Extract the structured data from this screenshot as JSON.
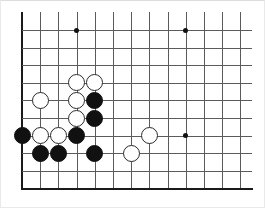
{
  "figure": {
    "board_size": 19,
    "view": "lower-left corner crop",
    "visible_columns": 13,
    "visible_rows": 10
  },
  "board": {
    "origin_x": 22,
    "origin_y": 30,
    "spacing_x": 18.2,
    "spacing_y": 17.6,
    "columns": 13,
    "rows": 10,
    "grid_color": "#5b5b5b",
    "edge_color": "#1a1a1a",
    "background_color": "#ffffff",
    "left_edge_is_board_border": true,
    "bottom_edge_is_board_border": true,
    "grid_bleeds_top": true,
    "grid_bleeds_right": true,
    "grid_top_overhang": 18,
    "grid_right_overhang": 12
  },
  "star_points": [
    {
      "name": "star-point-c4-top-left",
      "col": 4,
      "row": 1
    },
    {
      "name": "star-point-c10-top",
      "col": 10,
      "row": 1
    },
    {
      "name": "star-point-c10-r7",
      "col": 10,
      "row": 7
    }
  ],
  "stones": [
    {
      "name": "white-stone-c4-r4",
      "color": "white",
      "col": 4,
      "row": 4
    },
    {
      "name": "white-stone-c5-r4",
      "color": "white",
      "col": 5,
      "row": 4
    },
    {
      "name": "white-stone-c2-r5",
      "color": "white",
      "col": 2,
      "row": 5
    },
    {
      "name": "white-stone-c4-r5",
      "color": "white",
      "col": 4,
      "row": 5
    },
    {
      "name": "black-stone-c5-r5",
      "color": "black",
      "col": 5,
      "row": 5
    },
    {
      "name": "white-stone-c4-r6",
      "color": "white",
      "col": 4,
      "row": 6
    },
    {
      "name": "black-stone-c5-r6",
      "color": "black",
      "col": 5,
      "row": 6
    },
    {
      "name": "black-stone-c1-r7",
      "color": "black",
      "col": 1,
      "row": 7
    },
    {
      "name": "white-stone-c2-r7",
      "color": "white",
      "col": 2,
      "row": 7
    },
    {
      "name": "white-stone-c3-r7",
      "color": "white",
      "col": 3,
      "row": 7
    },
    {
      "name": "black-stone-c4-r7",
      "color": "black",
      "col": 4,
      "row": 7
    },
    {
      "name": "white-stone-c8-r7",
      "color": "white",
      "col": 8,
      "row": 7
    },
    {
      "name": "black-stone-c2-r8",
      "color": "black",
      "col": 2,
      "row": 8
    },
    {
      "name": "black-stone-c3-r8",
      "color": "black",
      "col": 3,
      "row": 8
    },
    {
      "name": "black-stone-c5-r8",
      "color": "black",
      "col": 5,
      "row": 8
    },
    {
      "name": "white-stone-c7-r8",
      "color": "white",
      "col": 7,
      "row": 8
    }
  ],
  "counts": {
    "black_stones": 7,
    "white_stones": 9,
    "total_stones": 16
  }
}
